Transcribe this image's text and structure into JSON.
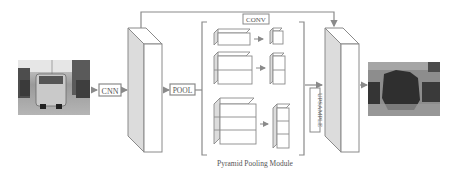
{
  "diagram": {
    "title": "Pyramid Pooling Module",
    "nodes": {
      "input_image": {
        "label": "input street scene image",
        "kind": "photo"
      },
      "cnn": {
        "label": "CNN"
      },
      "feature_map": {
        "label": "feature map",
        "kind": "3d-slab"
      },
      "pool": {
        "label": "POOL"
      },
      "conv": {
        "label": "CONV"
      },
      "upsample": {
        "label": "UPSAMPLE"
      },
      "concat_map": {
        "label": "concatenated feature map",
        "kind": "3d-slab"
      },
      "output_image": {
        "label": "segmentation prediction",
        "kind": "photo"
      }
    },
    "pyramid_levels": [
      {
        "level": 1,
        "pooled_grid": "1x1",
        "conv_out": "1x1"
      },
      {
        "level": 2,
        "pooled_grid": "2x2",
        "conv_out": "2x2"
      },
      {
        "level": 3,
        "pooled_grid": "3x3",
        "conv_out": "3x3"
      }
    ],
    "edges": [
      [
        "input_image",
        "cnn"
      ],
      [
        "cnn",
        "feature_map"
      ],
      [
        "feature_map",
        "pool"
      ],
      [
        "pool",
        "pyramid_levels"
      ],
      [
        "pyramid_levels",
        "upsample"
      ],
      [
        "upsample",
        "concat_map"
      ],
      [
        "feature_map",
        "concat_map",
        "skip"
      ],
      [
        "concat_map",
        "output_image"
      ]
    ],
    "caption": "Pyramid Pooling Module",
    "colors": {
      "stroke": "#8a8a8a",
      "face_shade": "#dcdcdc",
      "text": "#555555"
    }
  }
}
